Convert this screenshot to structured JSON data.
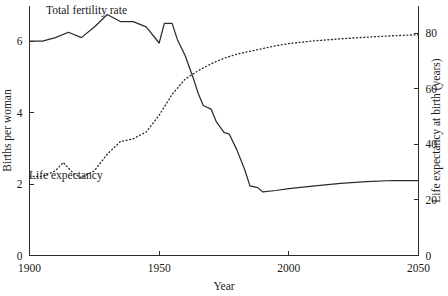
{
  "chart_data": {
    "type": "line",
    "title": "",
    "xlabel": "Year",
    "ylabel": "Births per woman",
    "y2label": "Life expectancy at birth (years)",
    "xlim": [
      1900,
      2050
    ],
    "ylim": [
      0,
      7.0
    ],
    "y2lim": [
      0,
      90
    ],
    "grid": false,
    "legend_position": "inline-annotations",
    "xticks": [
      1900,
      1950,
      2000,
      2050
    ],
    "xtick_labels": [
      "1900",
      "1950",
      "2000",
      "2050"
    ],
    "yticks": [
      0,
      2,
      4,
      6
    ],
    "ytick_labels": [
      "0",
      "2",
      "4",
      "6"
    ],
    "y2ticks": [
      0,
      20,
      40,
      60,
      80
    ],
    "y2tick_labels": [
      "0",
      "20",
      "40",
      "60",
      "80"
    ],
    "annotations": [
      {
        "text": "Total fertility rate",
        "x": 1922,
        "y": 6.75
      },
      {
        "text": "Life expectancy",
        "x": 1914,
        "y": 2.15
      }
    ],
    "series": [
      {
        "name": "Total fertility rate",
        "axis": "left",
        "style": "solid",
        "x": [
          1900,
          1905,
          1910,
          1915,
          1920,
          1925,
          1930,
          1935,
          1940,
          1945,
          1950,
          1952,
          1955,
          1957,
          1960,
          1963,
          1965,
          1967,
          1970,
          1972,
          1975,
          1977,
          1980,
          1983,
          1985,
          1988,
          1990,
          1995,
          2000,
          2010,
          2020,
          2030,
          2040,
          2050
        ],
        "values": [
          6.0,
          6.0,
          6.1,
          6.25,
          6.1,
          6.4,
          6.75,
          6.55,
          6.55,
          6.4,
          5.95,
          6.5,
          6.5,
          6.05,
          5.6,
          5.0,
          4.55,
          4.2,
          4.1,
          3.75,
          3.45,
          3.4,
          2.95,
          2.4,
          1.95,
          1.9,
          1.78,
          1.82,
          1.87,
          1.95,
          2.02,
          2.07,
          2.1,
          2.1
        ]
      },
      {
        "name": "Life expectancy",
        "axis": "right",
        "style": "dotted",
        "x": [
          1900,
          1905,
          1910,
          1913,
          1917,
          1920,
          1925,
          1930,
          1935,
          1940,
          1945,
          1950,
          1955,
          1960,
          1965,
          1970,
          1975,
          1980,
          1985,
          1990,
          1995,
          2000,
          2010,
          2020,
          2030,
          2040,
          2050
        ],
        "values": [
          28.5,
          28.5,
          30.5,
          33.5,
          29.5,
          28.0,
          30.5,
          36.5,
          41.0,
          42.0,
          44.5,
          50.5,
          58.0,
          63.5,
          66.5,
          69.0,
          71.0,
          72.5,
          73.5,
          74.5,
          75.5,
          76.3,
          77.3,
          78.0,
          78.6,
          79.1,
          79.5
        ]
      }
    ]
  }
}
